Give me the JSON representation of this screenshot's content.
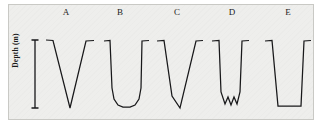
{
  "figure": {
    "axis": {
      "y_label": "Depth (m)",
      "scale_bar": {
        "name": "depth-scale-bar",
        "style": "i-beam",
        "x": 35,
        "y_top": 40,
        "y_bottom": 108,
        "cap_half_width": 3.5
      }
    },
    "panel": {
      "background_color": "#eeeeec",
      "border_color": "#c9c9c5",
      "x": 8,
      "y": 4,
      "width": 306,
      "height": 116
    },
    "line_color": "#18181a",
    "profiles": [
      {
        "label": "A",
        "name": "profile-a",
        "shape": "sharp-v",
        "label_x": 66,
        "points": "46,40 53,40.5 70,108 86,41 94,40.5"
      },
      {
        "label": "B",
        "name": "profile-b",
        "shape": "u-shaped-flat-floor",
        "label_x": 120,
        "points": "104,41 110,40.5 112,88 114,99 118,105 123,107 130,107 135,105 139,99 141,88 142,41 149,40.5"
      },
      {
        "label": "C",
        "name": "profile-c",
        "shape": "asymmetric-v",
        "label_x": 177,
        "points": "157,41 164,40.5 172,96 180,108 196,41 203,40.5"
      },
      {
        "label": "D",
        "name": "profile-d",
        "shape": "v-with-jagged-floor",
        "label_x": 232,
        "points": "212,41 219,40.5 221,92 225,104 228,97 231,105 234,97 237,104 240,92 242,41 249,40.5"
      },
      {
        "label": "E",
        "name": "profile-e",
        "shape": "trapezoid-flat-floor",
        "label_x": 288,
        "points": "265,41 272,40.5 278,106 301,106 304,41 311,40.5"
      }
    ]
  },
  "chart_data": {
    "type": "line",
    "title": "",
    "xlabel": "",
    "ylabel": "Depth (m)",
    "legend": [],
    "grid": false,
    "annotations": [
      "A",
      "B",
      "C",
      "D",
      "E"
    ],
    "series": [
      {
        "name": "A",
        "description": "sharp V-shaped cross-section"
      },
      {
        "name": "B",
        "description": "U-shaped cross-section with rounded flat floor"
      },
      {
        "name": "C",
        "description": "asymmetric V-shaped cross-section, steeper left wall"
      },
      {
        "name": "D",
        "description": "steep-walled cross-section with jagged irregular floor"
      },
      {
        "name": "E",
        "description": "trapezoidal cross-section with flat floor"
      }
    ]
  }
}
